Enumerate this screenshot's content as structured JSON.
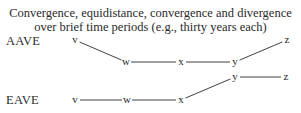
{
  "title": {
    "line1": "Convergence, equidistance, convergence and divergence",
    "line2": "over brief time periods (e.g., thirty years each)"
  },
  "rows": [
    {
      "label": "AAVE",
      "points": [
        {
          "name": "v",
          "x": 75,
          "y": 40
        },
        {
          "name": "w",
          "x": 126,
          "y": 62
        },
        {
          "name": "x",
          "x": 181,
          "y": 62
        },
        {
          "name": "y",
          "x": 235,
          "y": 62
        },
        {
          "name": "z",
          "x": 287,
          "y": 40
        }
      ]
    },
    {
      "label": "EAVE",
      "points": [
        {
          "name": "v",
          "x": 75,
          "y": 100
        },
        {
          "name": "w",
          "x": 127,
          "y": 100
        },
        {
          "name": "x",
          "x": 181,
          "y": 100
        },
        {
          "name": "y",
          "x": 235,
          "y": 77
        },
        {
          "name": "z",
          "x": 286,
          "y": 77
        }
      ]
    }
  ],
  "colors": {
    "ink": "#2a2a2a",
    "background": "#ffffff"
  }
}
